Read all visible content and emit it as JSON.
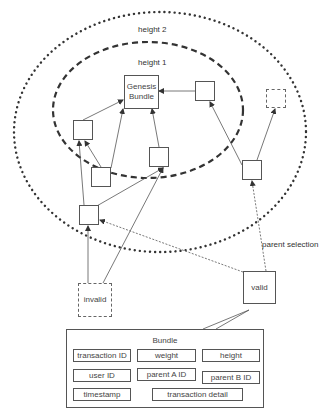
{
  "diagram": {
    "labels": {
      "height_2": "height 2",
      "height_1": "height 1",
      "parent_selection": "parent selection"
    },
    "nodes": {
      "genesis": "Genesis\nBundle",
      "genesis_line1": "Genesis",
      "genesis_line2": "Bundle",
      "invalid": "invalid",
      "valid": "valid"
    },
    "bundle_structure": {
      "title": "Bundle",
      "fields": [
        "transaction ID",
        "weight",
        "height",
        "user ID",
        "parent A ID",
        "parent B ID",
        "timestamp",
        "transaction detail"
      ]
    },
    "colors": {
      "line": "#555555",
      "text": "#444444",
      "background": "#ffffff"
    }
  }
}
